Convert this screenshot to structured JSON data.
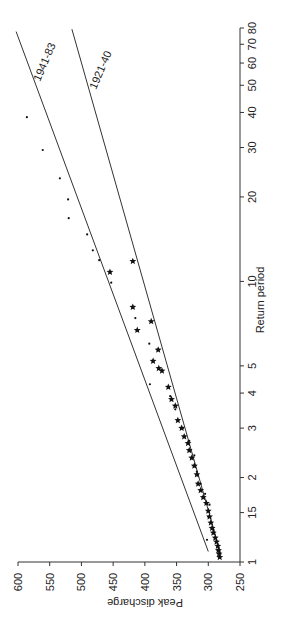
{
  "chart_data": {
    "type": "scatter",
    "orientation": "rotated-90-clockwise",
    "title": "",
    "xlabel": "Return period",
    "ylabel": "Peak discharge",
    "x_scale": "log",
    "xlim": [
      1,
      80
    ],
    "ylim": [
      250,
      600
    ],
    "x_ticks": [
      1,
      1.5,
      2,
      3,
      4,
      5,
      10,
      20,
      30,
      40,
      50,
      60,
      70,
      80
    ],
    "x_tick_labels": [
      "1",
      "15",
      "2",
      "3",
      "4",
      "5",
      "10",
      "20",
      "30",
      "40",
      "50",
      "60",
      "70",
      "80"
    ],
    "y_ticks": [
      250,
      300,
      350,
      400,
      450,
      500,
      550,
      600
    ],
    "y_tick_labels": [
      "250",
      "300",
      "350",
      "400",
      "450",
      "500",
      "550",
      "600"
    ],
    "grid": false,
    "legend": "inline line labels",
    "series": [
      {
        "name": "1941-83",
        "marker": "dot",
        "points": [
          {
            "x": 38.5,
            "y": 586
          },
          {
            "x": 29.4,
            "y": 561
          },
          {
            "x": 23.3,
            "y": 534
          },
          {
            "x": 19.6,
            "y": 521
          },
          {
            "x": 16.8,
            "y": 520
          },
          {
            "x": 14.7,
            "y": 491
          },
          {
            "x": 12.9,
            "y": 482
          },
          {
            "x": 11.9,
            "y": 472
          },
          {
            "x": 9.9,
            "y": 453
          },
          {
            "x": 7.4,
            "y": 415
          },
          {
            "x": 6.0,
            "y": 393
          },
          {
            "x": 4.3,
            "y": 392
          },
          {
            "x": 3.9,
            "y": 360
          },
          {
            "x": 3.5,
            "y": 352
          },
          {
            "x": 3.0,
            "y": 340
          },
          {
            "x": 2.7,
            "y": 330
          },
          {
            "x": 2.4,
            "y": 322
          },
          {
            "x": 2.1,
            "y": 318
          },
          {
            "x": 1.9,
            "y": 312
          },
          {
            "x": 1.75,
            "y": 305
          },
          {
            "x": 1.6,
            "y": 298
          },
          {
            "x": 1.45,
            "y": 300
          },
          {
            "x": 1.3,
            "y": 292
          },
          {
            "x": 1.2,
            "y": 302
          }
        ]
      },
      {
        "name": "1921-40",
        "marker": "star",
        "points": [
          {
            "x": 11.8,
            "y": 419
          },
          {
            "x": 10.8,
            "y": 455
          },
          {
            "x": 8.1,
            "y": 419
          },
          {
            "x": 6.7,
            "y": 412
          },
          {
            "x": 7.2,
            "y": 390
          },
          {
            "x": 5.7,
            "y": 379
          },
          {
            "x": 5.2,
            "y": 387
          },
          {
            "x": 4.9,
            "y": 378
          },
          {
            "x": 4.8,
            "y": 373
          },
          {
            "x": 4.2,
            "y": 363
          },
          {
            "x": 3.8,
            "y": 358
          },
          {
            "x": 3.6,
            "y": 352
          },
          {
            "x": 3.2,
            "y": 348
          },
          {
            "x": 3.0,
            "y": 342
          },
          {
            "x": 2.8,
            "y": 338
          },
          {
            "x": 2.65,
            "y": 332
          },
          {
            "x": 2.5,
            "y": 330
          },
          {
            "x": 2.35,
            "y": 326
          },
          {
            "x": 2.2,
            "y": 322
          },
          {
            "x": 2.05,
            "y": 318
          },
          {
            "x": 1.9,
            "y": 316
          },
          {
            "x": 1.8,
            "y": 312
          },
          {
            "x": 1.7,
            "y": 308
          },
          {
            "x": 1.62,
            "y": 303
          },
          {
            "x": 1.52,
            "y": 300
          },
          {
            "x": 1.45,
            "y": 298
          },
          {
            "x": 1.38,
            "y": 296
          },
          {
            "x": 1.32,
            "y": 294
          },
          {
            "x": 1.27,
            "y": 292
          },
          {
            "x": 1.22,
            "y": 289
          },
          {
            "x": 1.18,
            "y": 287
          },
          {
            "x": 1.14,
            "y": 285
          },
          {
            "x": 1.1,
            "y": 284
          },
          {
            "x": 1.07,
            "y": 283
          },
          {
            "x": 1.04,
            "y": 282
          }
        ]
      }
    ],
    "fit_lines": [
      {
        "name": "1941-83",
        "from": {
          "x": 1.09,
          "y": 300
        },
        "to": {
          "x": 77.7,
          "y": 603
        }
      },
      {
        "name": "1921-40",
        "from": {
          "x": 1.06,
          "y": 280
        },
        "to": {
          "x": 79.2,
          "y": 515
        }
      }
    ]
  },
  "labels": {
    "ylabel": "Peak discharge",
    "xlabel": "Return period",
    "line_a": "1941-83",
    "line_b": "1921-40"
  }
}
